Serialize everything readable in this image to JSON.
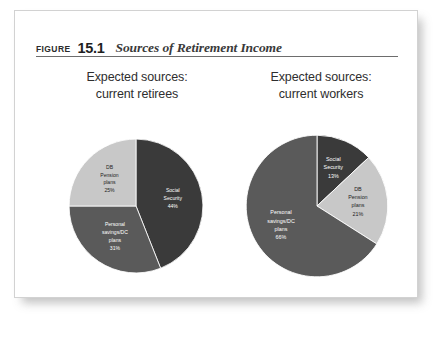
{
  "figure": {
    "figure_word": "Figure",
    "number": "15.1",
    "caption": "Sources of Retirement Income"
  },
  "panels": [
    {
      "heading_line1": "Expected sources:",
      "heading_line2": "current retirees"
    },
    {
      "heading_line1": "Expected sources:",
      "heading_line2": "current workers"
    }
  ],
  "colors": {
    "social_security": "#3a3a3a",
    "personal_savings": "#5a5a5a",
    "db_pension": "#c8c8c8",
    "card_border": "#d2d2d2",
    "rule": "#6d6d6d",
    "page_background": "#ffffff"
  },
  "chart_data": [
    {
      "type": "pie",
      "title": "Expected sources: current retirees",
      "start_angle_deg": 0,
      "direction": "clockwise",
      "labels": [
        "Social Security",
        "Personal savings/DC plans",
        "DB Pension plans"
      ],
      "values": [
        44,
        31,
        25
      ],
      "unit": "%",
      "slices": [
        {
          "label": "Social Security",
          "label_lines": [
            "Social",
            "Security",
            "44%"
          ],
          "value": 44,
          "display_value": "44%",
          "color": "#3a3a3a",
          "text_color": "#ffffff"
        },
        {
          "label": "Personal savings/DC plans",
          "label_lines": [
            "Personal",
            "savings/DC",
            "plans",
            "31%"
          ],
          "value": 31,
          "display_value": "31%",
          "color": "#5a5a5a",
          "text_color": "#ffffff"
        },
        {
          "label": "DB Pension plans",
          "label_lines": [
            "DB",
            "Pension",
            "plans",
            "25%"
          ],
          "value": 25,
          "display_value": "25%",
          "color": "#c8c8c8",
          "text_color": "#1d1d1d"
        }
      ]
    },
    {
      "type": "pie",
      "title": "Expected sources: current workers",
      "start_angle_deg": 0,
      "direction": "clockwise",
      "labels": [
        "Social Security",
        "DB Pension plans",
        "Personal savings/DC plans"
      ],
      "values": [
        13,
        21,
        66
      ],
      "unit": "%",
      "slices": [
        {
          "label": "Social Security",
          "label_lines": [
            "Social",
            "Security",
            "13%"
          ],
          "value": 13,
          "display_value": "13%",
          "color": "#3a3a3a",
          "text_color": "#ffffff"
        },
        {
          "label": "DB Pension plans",
          "label_lines": [
            "DB",
            "Pension",
            "plans",
            "21%"
          ],
          "value": 21,
          "display_value": "21%",
          "color": "#c8c8c8",
          "text_color": "#1d1d1d"
        },
        {
          "label": "Personal savings/DC plans",
          "label_lines": [
            "Personal",
            "savings/DC",
            "plans",
            "66%"
          ],
          "value": 66,
          "display_value": "66%",
          "color": "#5a5a5a",
          "text_color": "#ffffff"
        }
      ]
    }
  ]
}
